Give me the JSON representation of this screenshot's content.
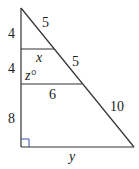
{
  "diagram": {
    "type": "geometry",
    "labels": {
      "left_top": "4",
      "left_mid": "4",
      "left_bottom": "8",
      "hyp_top": "5",
      "hyp_mid": "5",
      "hyp_bottom": "10",
      "seg_top": "x",
      "seg_mid": "6",
      "base": "y",
      "angle": "z°"
    },
    "colors": {
      "line": "#333333",
      "right_angle_marker": "#3355aa"
    }
  }
}
